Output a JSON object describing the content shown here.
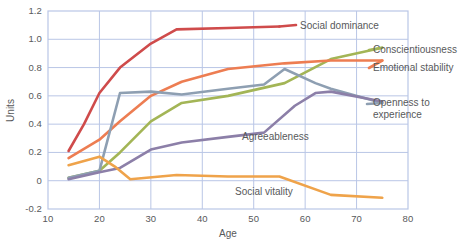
{
  "chart_data": {
    "type": "line",
    "title": "",
    "xlabel": "Age",
    "ylabel": "Units",
    "xlim": [
      10,
      80
    ],
    "ylim": [
      -0.2,
      1.2
    ],
    "xticks": [
      10,
      20,
      30,
      40,
      50,
      60,
      70,
      80
    ],
    "xtick_labels": [
      "10",
      "20",
      "30",
      "40",
      "50",
      "60",
      "70",
      "80"
    ],
    "yticks": [
      -0.2,
      0,
      0.2,
      0.4,
      0.6,
      0.8,
      1.0,
      1.2
    ],
    "ytick_labels": [
      "-0.2",
      "0",
      "0.2",
      "0.4",
      "0.6",
      "0.8",
      "1.0",
      "1.2"
    ],
    "grid": true,
    "legend_position": "inline-right",
    "series": [
      {
        "name": "Social dominance",
        "color": "#cf4b4b",
        "x": [
          14,
          17,
          20,
          24,
          30,
          35,
          45,
          55
        ],
        "y": [
          0.21,
          0.4,
          0.62,
          0.8,
          0.97,
          1.07,
          1.08,
          1.09
        ],
        "label_x": 300,
        "label_y": 20
      },
      {
        "name": "Conscientiousness",
        "color": "#a3b556",
        "x": [
          14,
          20,
          24,
          30,
          36,
          45,
          56,
          65,
          75
        ],
        "y": [
          0.02,
          0.07,
          0.2,
          0.42,
          0.55,
          0.6,
          0.69,
          0.86,
          0.94
        ],
        "label_x": 373,
        "label_y": 44
      },
      {
        "name": "Emotional stability",
        "color": "#ed7d52",
        "x": [
          14,
          20,
          24,
          30,
          36,
          45,
          56,
          65,
          75
        ],
        "y": [
          0.16,
          0.29,
          0.42,
          0.6,
          0.7,
          0.79,
          0.83,
          0.85,
          0.85
        ],
        "label_x": 373,
        "label_y": 62
      },
      {
        "name": "Openness to experience",
        "color": "#8e9fb2",
        "x": [
          14,
          20,
          24,
          30,
          36,
          45,
          52,
          56,
          62,
          65,
          75
        ],
        "y": [
          0.02,
          0.07,
          0.62,
          0.63,
          0.61,
          0.65,
          0.68,
          0.79,
          0.69,
          0.65,
          0.55
        ],
        "label_x": 373,
        "label_y": 97
      },
      {
        "name": "Agreeableness",
        "color": "#8c7fa8",
        "x": [
          14,
          20,
          24,
          30,
          36,
          45,
          52,
          58,
          62,
          65,
          75
        ],
        "y": [
          0.01,
          0.06,
          0.09,
          0.22,
          0.27,
          0.31,
          0.34,
          0.53,
          0.62,
          0.63,
          0.56
        ],
        "label_x": 242,
        "label_y": 131
      },
      {
        "name": "Social vitality",
        "color": "#efa34a",
        "x": [
          14,
          20,
          23,
          26,
          35,
          45,
          55,
          65,
          75
        ],
        "y": [
          0.11,
          0.17,
          0.1,
          0.01,
          0.04,
          0.03,
          0.03,
          -0.1,
          -0.12
        ],
        "label_x": 235,
        "label_y": 186
      }
    ]
  }
}
